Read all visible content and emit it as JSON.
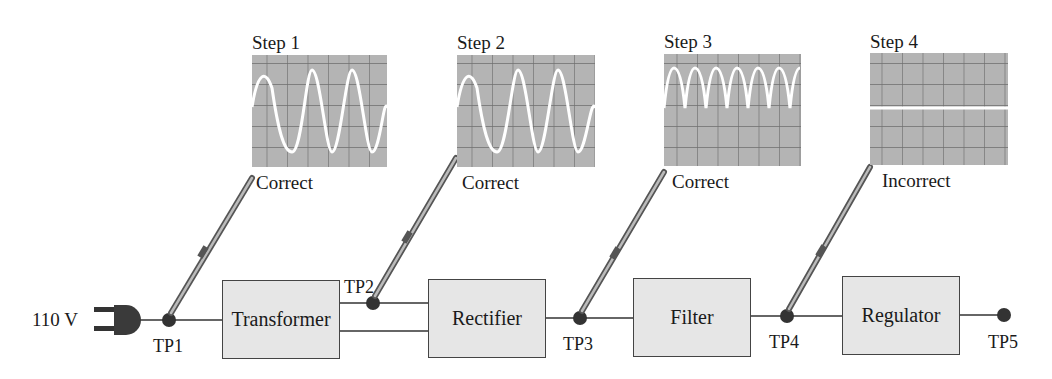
{
  "source": {
    "label": "110 V"
  },
  "blocks": [
    {
      "id": "transformer",
      "label": "Transformer"
    },
    {
      "id": "rectifier",
      "label": "Rectifier"
    },
    {
      "id": "filter",
      "label": "Filter"
    },
    {
      "id": "regulator",
      "label": "Regulator"
    }
  ],
  "test_points": [
    {
      "id": "tp1",
      "label": "TP1"
    },
    {
      "id": "tp2",
      "label": "TP2"
    },
    {
      "id": "tp3",
      "label": "TP3"
    },
    {
      "id": "tp4",
      "label": "TP4"
    },
    {
      "id": "tp5",
      "label": "TP5"
    }
  ],
  "steps": [
    {
      "label": "Step 1",
      "result": "Correct",
      "waveform": "sine",
      "probe_at": "TP1"
    },
    {
      "label": "Step 2",
      "result": "Correct",
      "waveform": "sine",
      "probe_at": "TP2"
    },
    {
      "label": "Step 3",
      "result": "Correct",
      "waveform": "full-wave rectified",
      "probe_at": "TP3"
    },
    {
      "label": "Step 4",
      "result": "Incorrect",
      "waveform": "flat line (0 V)",
      "probe_at": "TP4"
    }
  ],
  "colors": {
    "screen_bg": "#b4b4b4",
    "grid": "#6e6e6e",
    "trace": "#ffffff",
    "block_fill": "#e6e6e6",
    "node": "#333333"
  }
}
